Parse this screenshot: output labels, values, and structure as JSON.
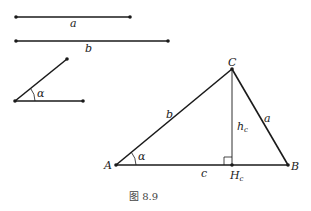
{
  "figure": {
    "caption": "图 8.9",
    "segments": {
      "a_label": "a",
      "b_label": "b"
    },
    "angle": {
      "label": "α"
    },
    "triangle": {
      "vertex_A": "A",
      "vertex_B": "B",
      "vertex_C": "C",
      "side_a": "a",
      "side_b": "b",
      "side_c": "c",
      "height_label": "h",
      "height_sub": "c",
      "foot_label": "H",
      "foot_sub": "c",
      "angle_label": "α"
    },
    "colors": {
      "line": "#1a1a1a",
      "text": "#222222"
    }
  }
}
